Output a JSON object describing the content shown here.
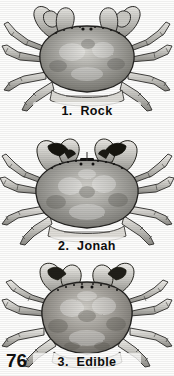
{
  "page": {
    "number": "76",
    "background_color": "#fdfdfc",
    "ink_color": "#0d0d0d",
    "kind": "printed-plate"
  },
  "figures": [
    {
      "index": "1.",
      "name": "Rock",
      "caption": "1.  Rock",
      "icon": "crab-icon",
      "carapace_shape": "broad-oval",
      "claw_style": "plain-tips",
      "tone": "#8e8e8e"
    },
    {
      "index": "2.",
      "name": "Jonah",
      "caption": "2.  Jonah",
      "icon": "crab-icon",
      "carapace_shape": "wide-fan",
      "claw_style": "black-tips",
      "tone": "#9a9a98"
    },
    {
      "index": "3.",
      "name": "Edible",
      "caption": "3.  Edible",
      "icon": "crab-icon",
      "carapace_shape": "rounded-dome",
      "claw_style": "dark-tips",
      "tone": "#96948f"
    }
  ]
}
